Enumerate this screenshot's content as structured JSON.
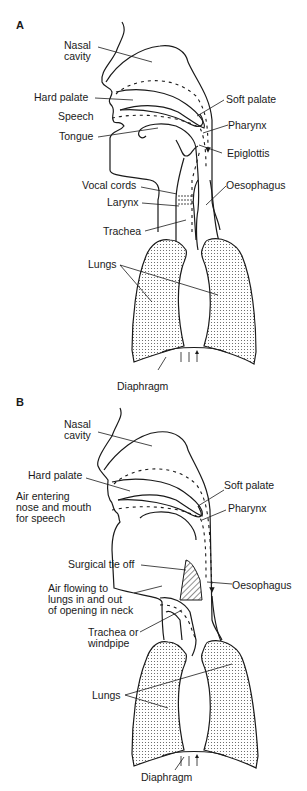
{
  "figure": {
    "panels": [
      {
        "id": "A",
        "label": "A",
        "labels": {
          "nasal_cavity_1": "Nasal",
          "nasal_cavity_2": "cavity",
          "hard_palate": "Hard palate",
          "speech": "Speech",
          "tongue": "Tongue",
          "soft_palate": "Soft palate",
          "pharynx": "Pharynx",
          "epiglottis": "Epiglottis",
          "vocal_cords": "Vocal cords",
          "larynx": "Larynx",
          "oesophagus": "Oesophagus",
          "trachea": "Trachea",
          "lungs": "Lungs",
          "diaphragm": "Diaphragm"
        }
      },
      {
        "id": "B",
        "label": "B",
        "labels": {
          "nasal_cavity_1": "Nasal",
          "nasal_cavity_2": "cavity",
          "hard_palate": "Hard palate",
          "air_entering_1": "Air entering",
          "air_entering_2": "nose and mouth",
          "air_entering_3": "for speech",
          "soft_palate": "Soft palate",
          "pharynx": "Pharynx",
          "surgical_tie_off": "Surgical tie off",
          "air_flowing_1": "Air flowing to",
          "air_flowing_2": "lungs in and out",
          "air_flowing_3": "of opening in neck",
          "oesophagus": "Oesophagus",
          "trachea_1": "Trachea or",
          "trachea_2": "windpipe",
          "lungs": "Lungs",
          "diaphragm": "Diaphragm"
        }
      }
    ]
  }
}
